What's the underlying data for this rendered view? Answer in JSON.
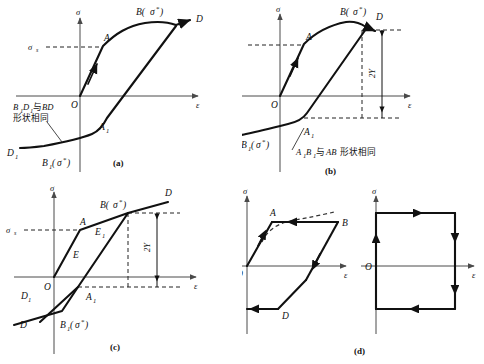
{
  "figure": {
    "panels": [
      "(a)",
      "(b)",
      "(c)",
      "(d)"
    ]
  },
  "axes": {
    "stress_symbol": "σ",
    "strain_symbol": "ε",
    "origin_label": "O",
    "yield_stress": "σ",
    "yield_stress_sub": "s"
  },
  "panel_a": {
    "caption": "(a)",
    "axis_y": "σ",
    "axis_x": "ε",
    "origin": "O",
    "yield_main": "σ",
    "yield_sub": "s",
    "point_A": "A",
    "point_D": "D",
    "point_B": "B(",
    "point_B_sigma": "σ",
    "point_B_star": "*",
    "point_B_close": ")",
    "point_A1": "A",
    "point_A1_sub": "1",
    "point_D1": "D",
    "point_D1_sub": "1",
    "point_B1": "B",
    "point_B1_sub": "1",
    "point_B1_open": "(",
    "point_B1_sigma": "σ",
    "point_B1_star": "*",
    "point_B1_close": ")",
    "note_line1_a": "B",
    "note_line1_a_sub": "1",
    "note_line1_b": "D",
    "note_line1_b_sub": "1",
    "note_line1_cn": "与",
    "note_line1_c": "BD",
    "note_line2": "形状相同"
  },
  "panel_b": {
    "caption": "(b)",
    "axis_y": "σ",
    "axis_x": "ε",
    "origin": "O",
    "yield_main": "σ",
    "yield_sub": "s",
    "point_A": "A",
    "point_D": "D",
    "point_B": "B(",
    "point_B_sigma": "σ",
    "point_B_star": "*",
    "point_B_close": ")",
    "point_A1": "A",
    "point_A1_sub": "1",
    "point_B1": "B",
    "point_B1_sub": "1",
    "point_B1_open": "(",
    "point_B1_sigma": "σ",
    "point_B1_star": "*",
    "point_B1_close": ")",
    "dimension": "2Y",
    "note_a": "A",
    "note_a_sub": "1",
    "note_b": "B",
    "note_b_sub": "1",
    "note_cn1": "与",
    "note_c": "AB",
    "note_cn2": "形状相同"
  },
  "panel_c": {
    "caption": "(c)",
    "axis_y": "σ",
    "axis_x": "ε",
    "origin": "O",
    "yield_main": "σ",
    "yield_sub": "s",
    "point_A": "A",
    "point_D": "D",
    "point_E": "E",
    "point_E1": "E",
    "point_E1_sub": "1",
    "point_B": "B(",
    "point_B_sigma": "σ",
    "point_B_star": "*",
    "point_B_close": ")",
    "point_A1": "A",
    "point_A1_sub": "1",
    "point_D1": "D",
    "point_D1_sub": "1",
    "point_D2": "D",
    "point_B1": "B",
    "point_B1_sub": "1",
    "point_B1_open": "(",
    "point_B1_sigma": "σ",
    "point_B1_star": "*",
    "point_B1_close": ")",
    "dimension": "2Y"
  },
  "panel_d": {
    "caption": "(d)",
    "left": {
      "axis_y": "σ",
      "axis_x": "ε",
      "origin": "O",
      "point_A": "A",
      "point_B": "B",
      "point_D": "D",
      "point_E": "E"
    },
    "right": {
      "axis_y": "σ",
      "axis_x": "ε",
      "origin": "O"
    }
  },
  "colors": {
    "curve": "#111111",
    "axis": "#4a4a4a",
    "dashed": "#222222",
    "background": "#ffffff"
  }
}
